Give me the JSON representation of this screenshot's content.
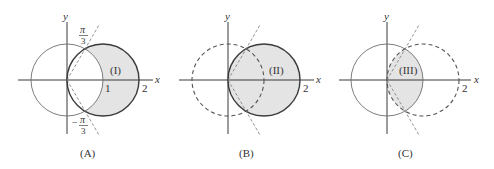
{
  "figure": {
    "panels": [
      {
        "id": "A",
        "caption": "(A)",
        "region_label": "(I)",
        "x_axis_label": "x",
        "y_axis_label": "y",
        "tick_1": "1",
        "tick_2": "2",
        "angle_top_num": "π",
        "angle_top_den": "3",
        "angle_bottom_sign": "−",
        "angle_bottom_num": "π",
        "angle_bottom_den": "3"
      },
      {
        "id": "B",
        "caption": "(B)",
        "region_label": "(II)",
        "x_axis_label": "x",
        "y_axis_label": "y",
        "tick_2": "2"
      },
      {
        "id": "C",
        "caption": "(C)",
        "region_label": "(III)",
        "x_axis_label": "x",
        "y_axis_label": "y",
        "tick_2": "2"
      }
    ],
    "colors": {
      "shade": "#e4e4e4",
      "stroke": "#3a3a3a"
    }
  }
}
